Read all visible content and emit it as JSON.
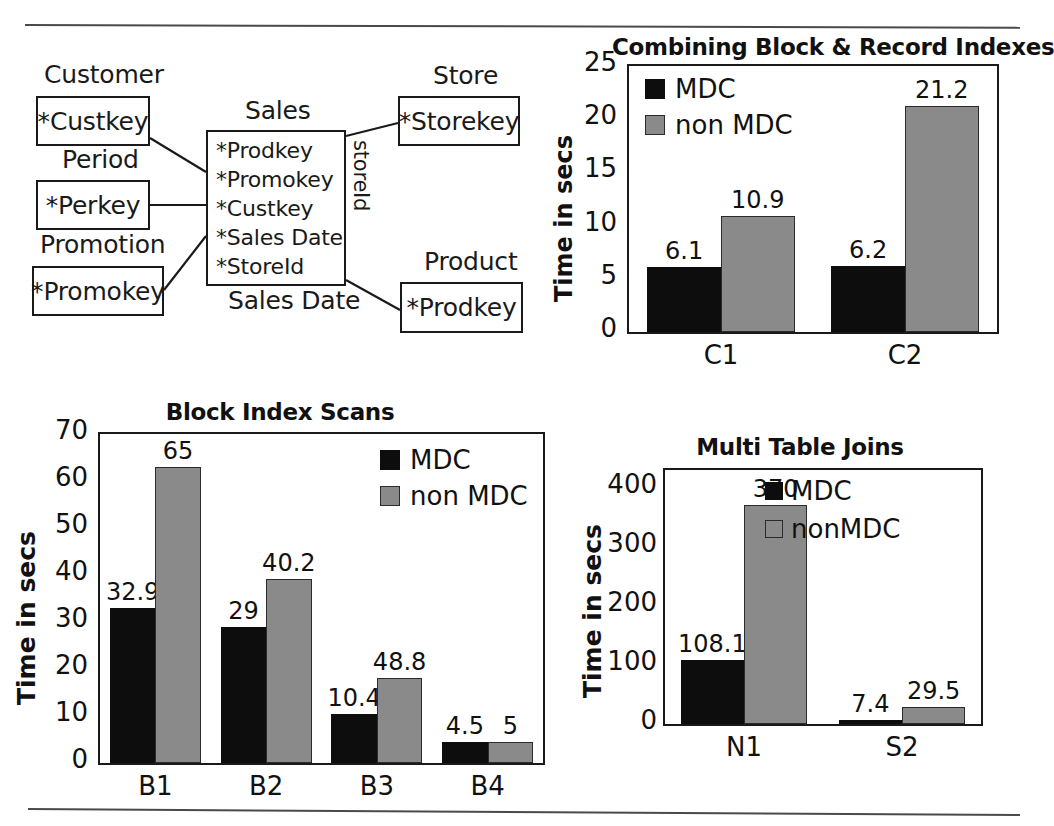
{
  "figure": {
    "rules": [
      "top-rule",
      "bottom-rule"
    ]
  },
  "er_diagram": {
    "name": "star-schema-diagram",
    "entities": [
      {
        "caption": "Customer",
        "key": "*Custkey"
      },
      {
        "caption": "Period",
        "key": "*Perkey"
      },
      {
        "caption": "Promotion",
        "key": "*Promokey"
      },
      {
        "caption": "Store",
        "key": "*Storekey"
      },
      {
        "caption": "Product",
        "key": "*Prodkey"
      }
    ],
    "fact": {
      "caption": "Sales",
      "columns": [
        "*Prodkey",
        "*Promokey",
        "*Custkey",
        "*Sales Date",
        "*StoreId"
      ],
      "below_label": "Sales Date",
      "side_label": "storeId"
    }
  },
  "charts": [
    {
      "id": "chart-combining",
      "chart_data": {
        "type": "bar",
        "title": "Combining Block & Record Indexes",
        "xlabel": "",
        "ylabel": "Time in secs",
        "categories": [
          "C1",
          "C2"
        ],
        "yticks": [
          0,
          5,
          10,
          15,
          20,
          25
        ],
        "ylim": [
          0,
          25
        ],
        "grid": false,
        "legend_position": "inside-top-left",
        "series": [
          {
            "name": "MDC",
            "color": "#0d0d0d",
            "values": [
              6.1,
              6.2
            ],
            "labels": [
              "6.1",
              "6.2"
            ]
          },
          {
            "name": "non MDC",
            "color": "#8a8a8a",
            "values": [
              10.9,
              21.2
            ],
            "labels": [
              "10.9",
              "21.2"
            ]
          }
        ]
      }
    },
    {
      "id": "chart-block",
      "chart_data": {
        "type": "bar",
        "title": "Block Index Scans",
        "xlabel": "",
        "ylabel": "Time in secs",
        "categories": [
          "B1",
          "B2",
          "B3",
          "B4"
        ],
        "yticks": [
          0,
          10,
          20,
          30,
          40,
          50,
          60,
          70
        ],
        "ylim": [
          0,
          70
        ],
        "grid": false,
        "legend_position": "inside-top-right",
        "series": [
          {
            "name": "MDC",
            "color": "#0d0d0d",
            "values": [
              32.9,
              29,
              10.4,
              4.5
            ],
            "labels": [
              "32.9",
              "29",
              "10.4",
              "4.5"
            ]
          },
          {
            "name": "non MDC",
            "color": "#8a8a8a",
            "values": [
              63,
              39.2,
              18,
              4.4
            ],
            "labels": [
              "65",
              "40.2",
              "48.8",
              "5"
            ]
          }
        ]
      }
    },
    {
      "id": "chart-joins",
      "chart_data": {
        "type": "bar",
        "title": "Multi Table Joins",
        "xlabel": "",
        "ylabel": "Time in secs",
        "categories": [
          "N1",
          "S2"
        ],
        "yticks": [
          0,
          100,
          200,
          300,
          400
        ],
        "ylim": [
          0,
          430
        ],
        "grid": false,
        "legend_position": "inside-top-right",
        "series": [
          {
            "name": "MDC",
            "color": "#0d0d0d",
            "values": [
              108.1,
              7.4
            ],
            "labels": [
              "108.1",
              "7.4"
            ]
          },
          {
            "name": "nonMDC",
            "color": "#8a8a8a",
            "values": [
              370,
              29.5
            ],
            "labels": [
              "370",
              "29.5"
            ]
          }
        ]
      }
    }
  ]
}
